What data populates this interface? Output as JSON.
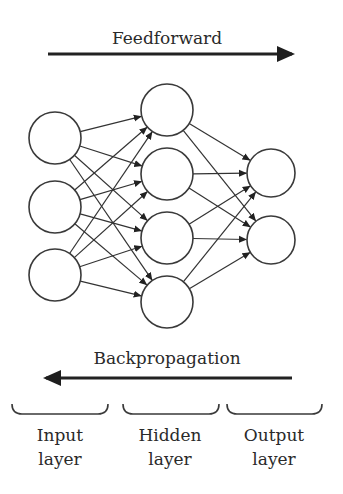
{
  "diagram": {
    "title_top": "Feedforward",
    "title_bottom": "Backpropagation",
    "colors": {
      "stroke": "#333333",
      "text": "#2a2a2a",
      "background": "#ffffff"
    },
    "layers": [
      {
        "id": "input",
        "label_line1": "Input",
        "label_line2": "layer",
        "node_count": 3,
        "nodes": [
          {
            "cx": 55,
            "cy": 138,
            "r": 26
          },
          {
            "cx": 55,
            "cy": 207,
            "r": 26
          },
          {
            "cx": 55,
            "cy": 275,
            "r": 26
          }
        ]
      },
      {
        "id": "hidden",
        "label_line1": "Hidden",
        "label_line2": "layer",
        "node_count": 4,
        "nodes": [
          {
            "cx": 167,
            "cy": 110,
            "r": 26
          },
          {
            "cx": 167,
            "cy": 174,
            "r": 26
          },
          {
            "cx": 167,
            "cy": 238,
            "r": 26
          },
          {
            "cx": 167,
            "cy": 302,
            "r": 26
          }
        ]
      },
      {
        "id": "output",
        "label_line1": "Output",
        "label_line2": "layer",
        "node_count": 2,
        "nodes": [
          {
            "cx": 271,
            "cy": 173,
            "r": 24
          },
          {
            "cx": 271,
            "cy": 240,
            "r": 24
          }
        ]
      }
    ],
    "connections": "fully-connected",
    "arrows": [
      {
        "name": "feedforward-arrow",
        "direction": "right",
        "x1": 48,
        "x2": 292,
        "y": 54
      },
      {
        "name": "backpropagation-arrow",
        "direction": "left",
        "x1": 292,
        "x2": 46,
        "y": 378
      }
    ],
    "brackets": [
      {
        "layer": "input",
        "x1": 12,
        "x2": 108
      },
      {
        "layer": "hidden",
        "x1": 123,
        "x2": 219
      },
      {
        "layer": "output",
        "x1": 227,
        "x2": 322
      }
    ]
  }
}
